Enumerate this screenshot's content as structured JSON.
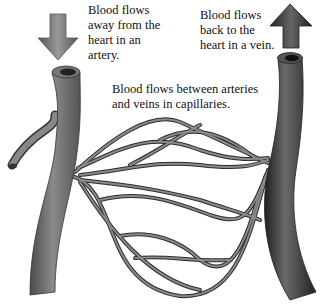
{
  "diagram": {
    "labels": {
      "artery": "Blood flows\naway from the\nheart in an\nartery.",
      "vein": "Blood flows\nback to the\nheart in a vein.",
      "capillaries": "Blood flows between arteries\nand veins in capillaries."
    },
    "arrows": [
      {
        "name": "artery-flow-arrow",
        "direction": "down"
      },
      {
        "name": "vein-flow-arrow",
        "direction": "up"
      }
    ],
    "colors": {
      "artery": "#6e6e6e",
      "vein": "#3a3a3a",
      "capillary": "#7a7a7a",
      "outline": "#2a2a2a",
      "text": "#111111"
    }
  }
}
